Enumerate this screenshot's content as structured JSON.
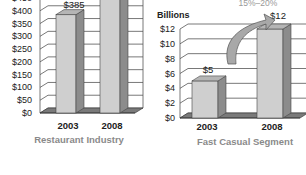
{
  "chart_data": [
    {
      "type": "bar",
      "title": "Restaurant Industry",
      "xlabel": "Restaurant Industry",
      "ylabel": "",
      "categories": [
        "2003",
        "2008"
      ],
      "values": [
        385,
        475
      ],
      "data_labels": [
        "$385",
        ""
      ],
      "yticks": [
        "$0",
        "$50",
        "$100",
        "$150",
        "$200",
        "$250",
        "$300",
        "$350",
        "$400",
        "$450"
      ],
      "ytick_values": [
        0,
        50,
        100,
        150,
        200,
        250,
        300,
        350,
        400,
        450
      ],
      "ylim": [
        0,
        450
      ],
      "grid": true,
      "style": "3d"
    },
    {
      "type": "bar",
      "title": "Fast Casual Segment",
      "xlabel": "Fast Casual Segment",
      "ylabel": "Billions",
      "categories": [
        "2003",
        "2008"
      ],
      "values": [
        5,
        12
      ],
      "data_labels": [
        "$5",
        "$12"
      ],
      "yticks": [
        "$0",
        "$2",
        "$4",
        "$6",
        "$8",
        "$10",
        "$12"
      ],
      "ytick_values": [
        0,
        2,
        4,
        6,
        8,
        10,
        12
      ],
      "ylim": [
        0,
        12
      ],
      "grid": true,
      "style": "3d",
      "annotation": "15%–20%"
    }
  ],
  "colors": {
    "bar_front": "#cfcfcf",
    "bar_side": "#8c8c8c",
    "bar_top": "#b5b5b5",
    "floor": "#7a7a7a",
    "grid": "#555555",
    "arrow": "#a8a8a8"
  }
}
